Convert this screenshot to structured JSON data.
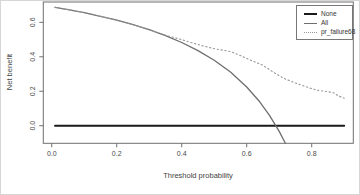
{
  "figure": {
    "background": "#ffffff",
    "frame_color": "#6f6f6f",
    "text_color": "#4a4a4a"
  },
  "chart_data": {
    "type": "line",
    "title": "",
    "xlabel": "Threshold probability",
    "ylabel": "Net benefit",
    "xlim": [
      -0.026,
      0.928
    ],
    "ylim": [
      -0.102,
      0.718
    ],
    "x_ticks": [
      0.0,
      0.2,
      0.4,
      0.6,
      0.8
    ],
    "y_ticks": [
      0.0,
      0.2,
      0.4,
      0.6
    ],
    "grid": false,
    "legend": {
      "position": "top-right",
      "border": true,
      "entries": [
        "None",
        "All",
        "pr_failure68"
      ]
    },
    "series": [
      {
        "name": "None",
        "style": "solid",
        "color": "#1a1a1a",
        "width": 1.9,
        "points": [
          [
            0.01,
            0.0
          ],
          [
            0.9,
            0.0
          ]
        ]
      },
      {
        "name": "All",
        "style": "solid",
        "color": "#6e6e6e",
        "width": 1.3,
        "points": [
          [
            0.01,
            0.687
          ],
          [
            0.05,
            0.674
          ],
          [
            0.1,
            0.656
          ],
          [
            0.15,
            0.635
          ],
          [
            0.2,
            0.613
          ],
          [
            0.25,
            0.587
          ],
          [
            0.3,
            0.557
          ],
          [
            0.35,
            0.523
          ],
          [
            0.4,
            0.483
          ],
          [
            0.45,
            0.436
          ],
          [
            0.5,
            0.38
          ],
          [
            0.55,
            0.311
          ],
          [
            0.6,
            0.225
          ],
          [
            0.64,
            0.139
          ],
          [
            0.67,
            0.06
          ],
          [
            0.7,
            -0.033
          ],
          [
            0.719,
            -0.102
          ]
        ]
      },
      {
        "name": "pr_failure68",
        "style": "dotted",
        "color": "#979797",
        "width": 1.1,
        "points": [
          [
            0.01,
            0.687
          ],
          [
            0.05,
            0.674
          ],
          [
            0.1,
            0.656
          ],
          [
            0.15,
            0.635
          ],
          [
            0.2,
            0.613
          ],
          [
            0.25,
            0.587
          ],
          [
            0.3,
            0.557
          ],
          [
            0.33,
            0.537
          ],
          [
            0.36,
            0.52
          ],
          [
            0.4,
            0.5
          ],
          [
            0.43,
            0.482
          ],
          [
            0.46,
            0.466
          ],
          [
            0.5,
            0.447
          ],
          [
            0.53,
            0.437
          ],
          [
            0.55,
            0.43
          ],
          [
            0.58,
            0.408
          ],
          [
            0.6,
            0.39
          ],
          [
            0.62,
            0.374
          ],
          [
            0.65,
            0.35
          ],
          [
            0.67,
            0.325
          ],
          [
            0.7,
            0.29
          ],
          [
            0.72,
            0.27
          ],
          [
            0.75,
            0.248
          ],
          [
            0.78,
            0.228
          ],
          [
            0.8,
            0.215
          ],
          [
            0.82,
            0.205
          ],
          [
            0.85,
            0.198
          ],
          [
            0.87,
            0.19
          ],
          [
            0.88,
            0.175
          ],
          [
            0.9,
            0.16
          ]
        ]
      }
    ]
  }
}
